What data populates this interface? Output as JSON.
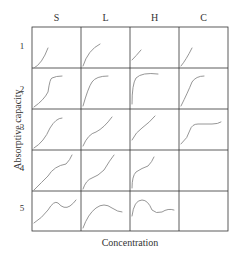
{
  "figure": {
    "column_labels": [
      "S",
      "L",
      "H",
      "C"
    ],
    "row_labels": [
      "1",
      "2",
      "3",
      "4",
      "5"
    ],
    "y_axis_label": "Absorptive capacity",
    "x_axis_label": "Concentration",
    "line_color": "#8a8a8a",
    "grid_color": "#333333",
    "cells": [
      {
        "row": 1,
        "col": "S",
        "curve": "convex rising"
      },
      {
        "row": 1,
        "col": "L",
        "curve": "concave rising"
      },
      {
        "row": 1,
        "col": "H",
        "curve": "steep start rising"
      },
      {
        "row": 1,
        "col": "C",
        "curve": "linear rising"
      },
      {
        "row": 2,
        "col": "S",
        "curve": "S-shaped rising with plateau"
      },
      {
        "row": 2,
        "col": "L",
        "curve": "concave to plateau"
      },
      {
        "row": 2,
        "col": "H",
        "curve": "vertical start then plateau"
      },
      {
        "row": 2,
        "col": "C",
        "curve": "rising to plateau"
      },
      {
        "row": 3,
        "col": "S",
        "curve": "S-shaped rising"
      },
      {
        "row": 3,
        "col": "L",
        "curve": "two-step rising"
      },
      {
        "row": 3,
        "col": "H",
        "curve": "step then rising"
      },
      {
        "row": 3,
        "col": "C",
        "curve": "rise then long plateau"
      },
      {
        "row": 4,
        "col": "S",
        "curve": "wavy rising"
      },
      {
        "row": 4,
        "col": "L",
        "curve": "stepped rising"
      },
      {
        "row": 4,
        "col": "H",
        "curve": "steep start then rising"
      },
      {
        "row": 4,
        "col": "C",
        "curve": "empty"
      },
      {
        "row": 5,
        "col": "S",
        "curve": "rise with maximum and minimum"
      },
      {
        "row": 5,
        "col": "L",
        "curve": "rise to maximum then fall"
      },
      {
        "row": 5,
        "col": "H",
        "curve": "steep rise to maximum then fall and rise"
      },
      {
        "row": 5,
        "col": "C",
        "curve": "empty"
      }
    ]
  }
}
